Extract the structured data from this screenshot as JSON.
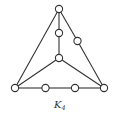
{
  "diagram": {
    "type": "graph",
    "caption": {
      "main": "K",
      "subscript": "4"
    },
    "nodes": [
      {
        "id": "top",
        "role": "vertex"
      },
      {
        "id": "center",
        "role": "vertex"
      },
      {
        "id": "bottom-left",
        "role": "vertex"
      },
      {
        "id": "bottom-right",
        "role": "vertex"
      },
      {
        "id": "sub-top-center",
        "role": "subdivision"
      },
      {
        "id": "sub-top-right",
        "role": "subdivision"
      },
      {
        "id": "sub-bottom-1",
        "role": "subdivision"
      },
      {
        "id": "sub-bottom-2",
        "role": "subdivision"
      }
    ],
    "edges": [
      [
        "top",
        "bottom-left"
      ],
      [
        "top",
        "sub-top-right"
      ],
      [
        "sub-top-right",
        "bottom-right"
      ],
      [
        "top",
        "sub-top-center"
      ],
      [
        "sub-top-center",
        "center"
      ],
      [
        "center",
        "bottom-left"
      ],
      [
        "center",
        "bottom-right"
      ],
      [
        "bottom-left",
        "sub-bottom-1"
      ],
      [
        "sub-bottom-1",
        "sub-bottom-2"
      ],
      [
        "sub-bottom-2",
        "bottom-right"
      ]
    ],
    "colors": {
      "stroke": "#333333",
      "node_fill": "#ffffff"
    }
  }
}
